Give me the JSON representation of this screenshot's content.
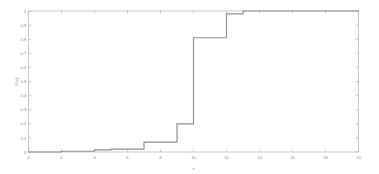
{
  "chart_data": {
    "type": "line",
    "subtype": "step-ecdf",
    "title": "",
    "xlabel": "x",
    "ylabel": "F(x)",
    "xlim": [
      0,
      20
    ],
    "ylim": [
      0,
      1
    ],
    "grid": false,
    "legend": null,
    "line_color": "#8f8f8f",
    "axis_color": "#b4b4b4",
    "background": "#ffffff",
    "xticks": [
      0,
      2,
      4,
      6,
      8,
      10,
      12,
      14,
      16,
      18,
      20
    ],
    "xtick_labels": [
      "0",
      "2",
      "4",
      "6",
      "8",
      "10",
      "12",
      "14",
      "16",
      "18",
      "20"
    ],
    "yticks": [
      0,
      0.1,
      0.2,
      0.3,
      0.4,
      0.5,
      0.6,
      0.7,
      0.8,
      0.9,
      1
    ],
    "ytick_labels": [
      "0",
      "0.1",
      "0.2",
      "0.3",
      "0.4",
      "0.5",
      "0.6",
      "0.7",
      "0.8",
      "0.9",
      "1"
    ],
    "x": [
      0,
      2,
      4,
      5,
      7,
      9,
      10,
      12,
      13,
      20
    ],
    "y": [
      0,
      0.005,
      0.015,
      0.02,
      0.07,
      0.2,
      0.81,
      0.98,
      1,
      1
    ],
    "steps": [
      {
        "x": 0,
        "y": 0
      },
      {
        "x": 2,
        "y": 0.005
      },
      {
        "x": 4,
        "y": 0.015
      },
      {
        "x": 5,
        "y": 0.02
      },
      {
        "x": 7,
        "y": 0.07
      },
      {
        "x": 9,
        "y": 0.2
      },
      {
        "x": 10,
        "y": 0.81
      },
      {
        "x": 12,
        "y": 0.98
      },
      {
        "x": 13,
        "y": 1.0
      },
      {
        "x": 20,
        "y": 1.0
      }
    ]
  }
}
